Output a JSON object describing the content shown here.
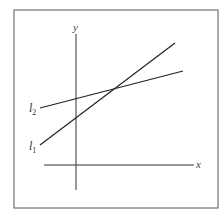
{
  "figure": {
    "type": "coordinate-plane-two-lines",
    "frame": {
      "x": 14,
      "y": 10,
      "width": 204,
      "height": 198,
      "stroke": "#555555"
    },
    "axes": {
      "x_label": "x",
      "y_label": "y",
      "x_axis": {
        "x1": 44,
        "y1": 165,
        "x2": 194,
        "y2": 165
      },
      "y_axis": {
        "x1": 76,
        "y1": 34,
        "x2": 76,
        "y2": 190
      },
      "color": "#333333"
    },
    "lines": [
      {
        "id": "l1",
        "label": "l",
        "subscript": "1",
        "x1": 40,
        "y1": 145,
        "x2": 175,
        "y2": 43,
        "color": "#222222"
      },
      {
        "id": "l2",
        "label": "l",
        "subscript": "2",
        "x1": 40,
        "y1": 108,
        "x2": 183,
        "y2": 71,
        "color": "#222222"
      }
    ],
    "intersection": {
      "x": 115,
      "y": 88
    }
  }
}
